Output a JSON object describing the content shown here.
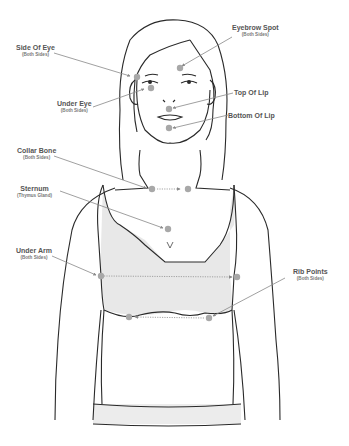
{
  "diagram": {
    "type": "acupressure-tapping-points",
    "colors": {
      "outline": "#2a2a2a",
      "point": "#a8a8a8",
      "pointer_line": "#888888",
      "garment_fill": "#e8e8e8",
      "label_text": "#555555"
    },
    "labels": [
      {
        "id": "eyebrow-spot",
        "title": "Eyebrow Spot",
        "subtitle": "(Both Sides)"
      },
      {
        "id": "side-of-eye",
        "title": "Side Of Eye",
        "subtitle": "(Both Sides)"
      },
      {
        "id": "top-of-lip",
        "title": "Top Of Lip",
        "subtitle": ""
      },
      {
        "id": "under-eye",
        "title": "Under Eye",
        "subtitle": "(Both Sides)"
      },
      {
        "id": "bottom-of-lip",
        "title": "Bottom Of Lip",
        "subtitle": ""
      },
      {
        "id": "collar-bone",
        "title": "Collar Bone",
        "subtitle": "(Both Sides)"
      },
      {
        "id": "sternum",
        "title": "Sternum",
        "subtitle": "(Thymus Gland)"
      },
      {
        "id": "under-arm",
        "title": "Under Arm",
        "subtitle": "(Both Sides)"
      },
      {
        "id": "rib-points",
        "title": "Rib Points",
        "subtitle": "(Both Sides)"
      }
    ]
  }
}
